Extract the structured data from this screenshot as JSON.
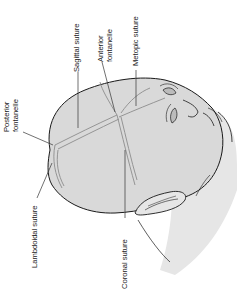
{
  "figure": {
    "type": "anatomical-illustration",
    "orientation": "rotated 90 degrees counter-clockwise",
    "colors": {
      "skull_fill": "#d9d9d9",
      "face_fill": "#e6e6e6",
      "outline": "#1a1a1a",
      "suture_line": "#8c8c8c",
      "leader_line": "#333333",
      "label_text": "#222222"
    }
  },
  "labels": {
    "posterior_fontanelle": {
      "line1": "Posterior",
      "line2": "fontanelle"
    },
    "sagittal_suture": {
      "text": "Sagittal suture"
    },
    "anterior_fontanelle": {
      "line1": "Anterior",
      "line2": "fontanelle"
    },
    "metopic_suture": {
      "text": "Metopic suture"
    },
    "lambdoidal_suture": {
      "text": "Lambdoidal suture"
    },
    "coronal_suture": {
      "text": "Coronal suture"
    }
  }
}
